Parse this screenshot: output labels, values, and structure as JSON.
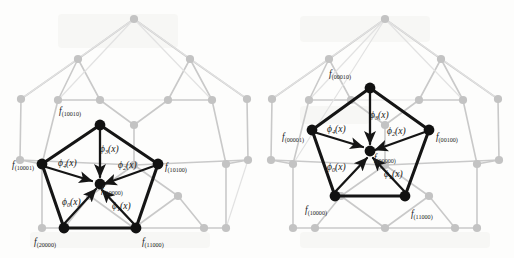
{
  "figure": {
    "type": "diagram",
    "width": 514,
    "height": 258,
    "background_color": "#fdfdfc",
    "foreground_color": "#151515",
    "background_graph_color": "#c9c9c9"
  },
  "panels": [
    {
      "id": "left",
      "name": "left-pentagon-diagram",
      "center_label": "f",
      "center_subscript": "(10000)",
      "vertices": [
        {
          "label": "f",
          "subscript": "(10010)",
          "position": "top"
        },
        {
          "label": "f",
          "subscript": "(10001)",
          "position": "left"
        },
        {
          "label": "f",
          "subscript": "(10100)",
          "position": "right"
        },
        {
          "label": "f",
          "subscript": "(20000)",
          "position": "bottom-left"
        },
        {
          "label": "f",
          "subscript": "(11000)",
          "position": "bottom-right"
        }
      ],
      "arrows": [
        {
          "label": "ϕ",
          "subscript": "0",
          "arg": "(x)",
          "from": "bottom-left",
          "to": "center"
        },
        {
          "label": "ϕ",
          "subscript": "1",
          "arg": "(x)",
          "from": "bottom-right",
          "to": "center"
        },
        {
          "label": "ϕ",
          "subscript": "2",
          "arg": "(x)",
          "from": "right",
          "to": "center"
        },
        {
          "label": "ϕ",
          "subscript": "3",
          "arg": "(x)",
          "from": "top",
          "to": "center"
        },
        {
          "label": "ϕ",
          "subscript": "4",
          "arg": "(x)",
          "from": "left",
          "to": "center"
        }
      ]
    },
    {
      "id": "right",
      "name": "right-pentagon-diagram",
      "center_label": "f",
      "center_subscript": "(00000)",
      "vertices": [
        {
          "label": "f",
          "subscript": "(00010)",
          "position": "top"
        },
        {
          "label": "f",
          "subscript": "(00001)",
          "position": "left"
        },
        {
          "label": "f",
          "subscript": "(00100)",
          "position": "right"
        },
        {
          "label": "f",
          "subscript": "(10000)",
          "position": "bottom-left"
        },
        {
          "label": "f",
          "subscript": "(11000)",
          "position": "bottom-right"
        }
      ],
      "arrows": [
        {
          "label": "ϕ",
          "subscript": "0",
          "arg": "(x)",
          "from": "bottom-left",
          "to": "center"
        },
        {
          "label": "ϕ",
          "subscript": "1",
          "arg": "(x)",
          "from": "bottom-right",
          "to": "center"
        },
        {
          "label": "ϕ",
          "subscript": "2",
          "arg": "(x)",
          "from": "right",
          "to": "center"
        },
        {
          "label": "ϕ",
          "subscript": "3",
          "arg": "(x)",
          "from": "top",
          "to": "center"
        },
        {
          "label": "ϕ",
          "subscript": "4",
          "arg": "(x)",
          "from": "left",
          "to": "center"
        }
      ]
    }
  ]
}
